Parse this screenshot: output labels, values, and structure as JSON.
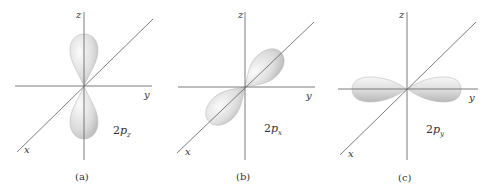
{
  "figure": {
    "panels": [
      {
        "id": "a",
        "caption": "(a)",
        "orbital_label": {
          "prefix": "2",
          "p": "p",
          "sub": "z"
        },
        "axes": {
          "x": "x",
          "y": "y",
          "z": "z"
        },
        "lobe_orientation": "z"
      },
      {
        "id": "b",
        "caption": "(b)",
        "orbital_label": {
          "prefix": "2",
          "p": "p",
          "sub": "x"
        },
        "axes": {
          "x": "x",
          "y": "y",
          "z": "z"
        },
        "lobe_orientation": "x"
      },
      {
        "id": "c",
        "caption": "(c)",
        "orbital_label": {
          "prefix": "2",
          "p": "p",
          "sub": "y"
        },
        "axes": {
          "x": "x",
          "y": "y",
          "z": "z"
        },
        "lobe_orientation": "y"
      }
    ],
    "colors": {
      "axis": "#6e6e6e",
      "lobe_light": "#f4f4f4",
      "lobe_dark": "#b8b8b8",
      "text": "#333333"
    }
  }
}
